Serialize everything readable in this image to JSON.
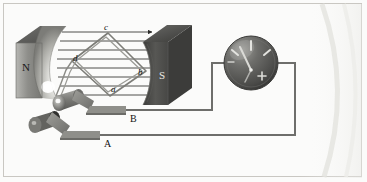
{
  "figure": {
    "background_color": "#fbfbfa",
    "border_color": "#c9c7c2"
  },
  "magnet": {
    "north": {
      "label": "N",
      "color": "#9a9a96",
      "x": 14,
      "y": 69
    },
    "south": {
      "label": "S",
      "color": "#4e4e4c",
      "x": 162,
      "y": 76
    },
    "field_line_count": 8,
    "field_line_color": "#3a3a38",
    "field_direction": "left-to-right"
  },
  "coil": {
    "shape": "diamond",
    "color": "#8b8b86",
    "corner_labels": [
      {
        "id": "c",
        "text": "c",
        "x": 105,
        "y": 28
      },
      {
        "id": "d",
        "text": "d",
        "x": 74,
        "y": 58
      },
      {
        "id": "b",
        "text": "b",
        "x": 139,
        "y": 72
      },
      {
        "id": "a",
        "text": "a",
        "x": 112,
        "y": 89
      }
    ]
  },
  "slip_rings": {
    "ring_color": "#7e7e7a",
    "brush_color": "#8d8d88",
    "terminals": [
      {
        "id": "B",
        "text": "B",
        "x": 130,
        "y": 112
      },
      {
        "id": "A",
        "text": "A",
        "x": 104,
        "y": 138
      }
    ]
  },
  "meter": {
    "name": "galvanometer",
    "center_x": 251,
    "center_y": 63,
    "radius": 27,
    "body_color": "#5a5a57",
    "needle_color": "#d8d8d4",
    "plus_mark": "+",
    "minus_mark": "−",
    "tick_count": 3
  },
  "wiring": {
    "wire_color": "#6e6e6b",
    "wire_width": 2,
    "terminal_b_path": "B → right → up → meter left terminal",
    "terminal_a_path": "A → right → up → meter right terminal"
  }
}
